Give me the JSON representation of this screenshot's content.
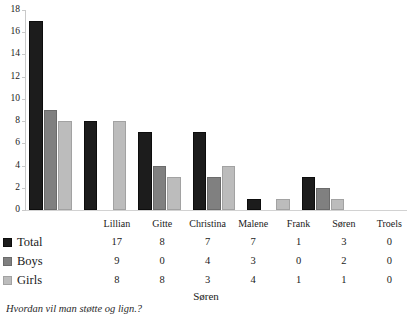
{
  "chart_data": {
    "type": "bar",
    "title": "",
    "xlabel": "Søren",
    "ylabel": "",
    "ylim": [
      0,
      18
    ],
    "ytick_step": 2,
    "yticks": [
      18,
      16,
      14,
      12,
      10,
      8,
      6,
      4,
      2,
      0
    ],
    "grid": false,
    "legend_position": "data-table-left",
    "categories": [
      "Lillian",
      "Gitte",
      "Christina",
      "Malene",
      "Frank",
      "Søren",
      "Troels"
    ],
    "series": [
      {
        "name": "Total",
        "color": "#1c1c1c",
        "values": [
          17,
          8,
          7,
          7,
          1,
          3,
          0
        ]
      },
      {
        "name": "Boys",
        "color": "#808080",
        "values": [
          9,
          0,
          4,
          3,
          0,
          2,
          0
        ]
      },
      {
        "name": "Girls",
        "color": "#bcbcbc",
        "values": [
          8,
          8,
          3,
          4,
          1,
          1,
          0
        ]
      }
    ],
    "data_table": {
      "row_labels": [
        "Total",
        "Boys",
        "Girls"
      ],
      "rows": [
        [
          17,
          8,
          7,
          7,
          1,
          3,
          0
        ],
        [
          9,
          0,
          4,
          3,
          0,
          2,
          0
        ],
        [
          8,
          8,
          3,
          4,
          1,
          1,
          0
        ]
      ]
    }
  },
  "caption": "Hvordan vil man støtte og lign.?"
}
